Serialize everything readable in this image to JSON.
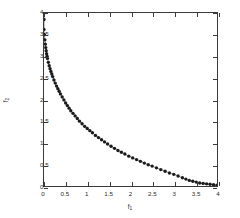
{
  "chart_data": {
    "type": "scatter",
    "title": "",
    "subtitle": "",
    "xlabel": "f_1",
    "ylabel": "f_2",
    "xlabel_base": "f",
    "xlabel_sub": "1",
    "ylabel_base": "f",
    "ylabel_sub": "2",
    "xlim": [
      0,
      4
    ],
    "ylim": [
      0,
      4
    ],
    "xticks": [
      0,
      0.5,
      1,
      1.5,
      2,
      2.5,
      3,
      3.5,
      4
    ],
    "yticks": [
      0,
      0.5,
      1,
      1.5,
      2,
      2.5,
      3,
      3.5,
      4
    ],
    "xticklabels": [
      "0",
      "0.5",
      "1",
      "1.5",
      "2",
      "2.5",
      "3",
      "3.5",
      "4"
    ],
    "yticklabels": [
      "0",
      "0.5",
      "1",
      "1.5",
      "2",
      "2.5",
      "3",
      "3.5",
      "4"
    ],
    "grid": false,
    "legend": null,
    "legend_position": "none",
    "marker": "dot",
    "marker_color": "#1a1a1a",
    "line_color": "#555555",
    "marker_size": 1.7,
    "line_width": 0.7,
    "series": [
      {
        "name": "Pareto front",
        "x": [
          0.0,
          0.0,
          0.0,
          0.01,
          0.02,
          0.03,
          0.04,
          0.05,
          0.06,
          0.07,
          0.08,
          0.1,
          0.12,
          0.14,
          0.16,
          0.18,
          0.2,
          0.23,
          0.26,
          0.29,
          0.32,
          0.35,
          0.38,
          0.42,
          0.46,
          0.5,
          0.54,
          0.58,
          0.62,
          0.67,
          0.72,
          0.77,
          0.82,
          0.88,
          0.94,
          1.0,
          1.06,
          1.12,
          1.19,
          1.26,
          1.33,
          1.4,
          1.47,
          1.55,
          1.63,
          1.71,
          1.79,
          1.87,
          1.96,
          2.05,
          2.14,
          2.23,
          2.32,
          2.41,
          2.5,
          2.6,
          2.7,
          2.8,
          2.9,
          3.0,
          3.1,
          3.2,
          3.28,
          3.36,
          3.44,
          3.52,
          3.6,
          3.68,
          3.76,
          3.84,
          3.92,
          4.0
        ],
        "y": [
          4.0,
          3.85,
          3.62,
          3.5,
          3.38,
          3.28,
          3.2,
          3.13,
          3.06,
          3.0,
          2.95,
          2.86,
          2.78,
          2.71,
          2.65,
          2.59,
          2.53,
          2.45,
          2.38,
          2.31,
          2.25,
          2.19,
          2.13,
          2.06,
          1.99,
          1.92,
          1.86,
          1.8,
          1.74,
          1.68,
          1.62,
          1.56,
          1.5,
          1.44,
          1.38,
          1.33,
          1.28,
          1.23,
          1.17,
          1.12,
          1.07,
          1.02,
          0.97,
          0.92,
          0.87,
          0.82,
          0.78,
          0.74,
          0.69,
          0.65,
          0.61,
          0.57,
          0.53,
          0.49,
          0.46,
          0.42,
          0.38,
          0.34,
          0.3,
          0.27,
          0.23,
          0.19,
          0.16,
          0.13,
          0.11,
          0.09,
          0.07,
          0.06,
          0.05,
          0.04,
          0.03,
          0.02
        ]
      }
    ]
  }
}
